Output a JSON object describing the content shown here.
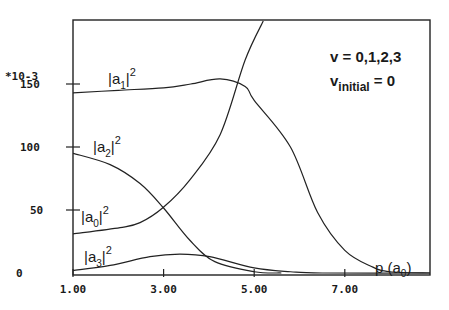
{
  "chart_data": {
    "type": "line",
    "title": "",
    "xlabel": "p (a0)",
    "ylabel": "",
    "y_multiplier_label": "*10-3",
    "xlim": [
      1.0,
      8.9
    ],
    "ylim": [
      0,
      200
    ],
    "x_ticks": [
      "1.00",
      "3.00",
      "5.00",
      "7.00"
    ],
    "y_ticks": [
      "0",
      "50",
      "100",
      "150"
    ],
    "grid": false,
    "annotations": [
      "v = 0,1,2,3",
      "v_initial = 0"
    ],
    "series": [
      {
        "name": "|a0|^2",
        "label_main": "|a",
        "label_sub": "0",
        "label_sup": "2",
        "x": [
          1.0,
          2.04,
          2.48,
          2.99,
          3.58,
          4.25,
          4.8,
          5.2
        ],
        "values": [
          31,
          36,
          40,
          52,
          74,
          110,
          169,
          200
        ]
      },
      {
        "name": "|a1|^2",
        "label_main": "|a",
        "label_sub": "1",
        "label_sup": "2",
        "x": [
          1.0,
          2.0,
          3.0,
          3.6,
          4.25,
          4.8,
          5.0,
          5.8,
          6.4,
          7.0,
          7.6,
          8.0,
          8.9
        ],
        "values": [
          143,
          145,
          147,
          150,
          154,
          148,
          137,
          100,
          48,
          18,
          5,
          1,
          0
        ]
      },
      {
        "name": "|a2|^2",
        "label_main": "|a",
        "label_sub": "2",
        "label_sup": "2",
        "x": [
          1.0,
          1.82,
          2.48,
          2.99,
          3.58,
          4.13,
          5.0,
          5.6
        ],
        "values": [
          95,
          86,
          71,
          52,
          26,
          9,
          1,
          0
        ]
      },
      {
        "name": "|a3|^2",
        "label_main": "|a",
        "label_sub": "3",
        "label_sup": "2",
        "x": [
          1.0,
          1.82,
          2.7,
          3.36,
          4.02,
          5.0,
          5.8,
          6.5,
          8.9
        ],
        "values": [
          2,
          6,
          13,
          15,
          13,
          4,
          1,
          0,
          0
        ]
      }
    ]
  },
  "legend": {
    "line1": "v = 0,1,2,3",
    "line2_main": "v",
    "line2_sub": "initial",
    "line2_tail": " = 0"
  },
  "axes": {
    "y_multiplier": "*10-3",
    "x_label_main": "p (a",
    "x_label_sub": "0",
    "x_label_tail": ")"
  }
}
